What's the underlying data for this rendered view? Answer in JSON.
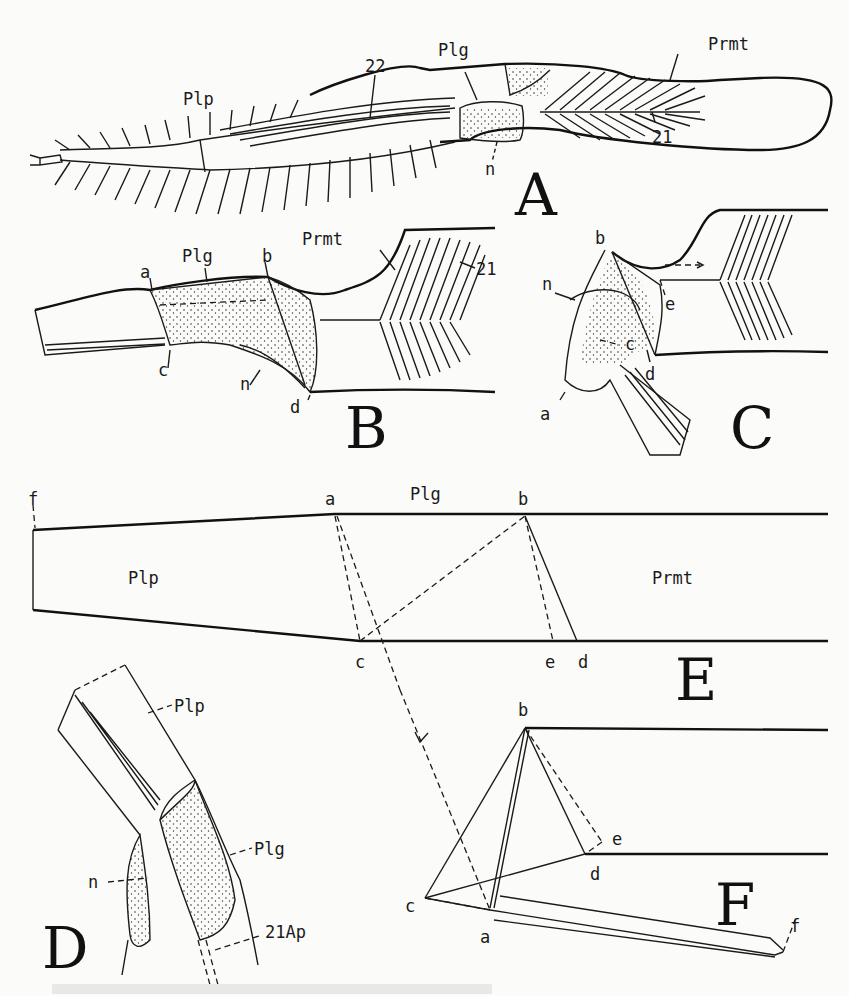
{
  "figure": {
    "panels": {
      "A": {
        "letter": "A",
        "labels": {
          "plp": "Plp",
          "n22": "22",
          "plg": "Plg",
          "prmt": "Prmt",
          "n21": "21",
          "n": "n"
        }
      },
      "B": {
        "letter": "B",
        "labels": {
          "plg": "Plg",
          "prmt": "Prmt",
          "a": "a",
          "b": "b",
          "c": "c",
          "n": "n",
          "d": "d",
          "n21": "21"
        }
      },
      "C": {
        "letter": "C",
        "labels": {
          "b": "b",
          "n": "n",
          "e": "e",
          "c": "c",
          "d": "d",
          "a": "a"
        }
      },
      "D": {
        "letter": "D",
        "labels": {
          "plp": "Plp",
          "plg": "Plg",
          "n": "n",
          "ap": "21Ap"
        }
      },
      "E": {
        "letter": "E",
        "labels": {
          "f": "f",
          "a": "a",
          "plg": "Plg",
          "b": "b",
          "plp": "Plp",
          "prmt": "Prmt",
          "c": "c",
          "e": "e",
          "d": "d"
        }
      },
      "F": {
        "letter": "F",
        "labels": {
          "b": "b",
          "e": "e",
          "d": "d",
          "c": "c",
          "a": "a",
          "f": "f"
        }
      }
    },
    "colors": {
      "ink": "#1a1a1a",
      "paper": "#fbfbf9"
    }
  }
}
